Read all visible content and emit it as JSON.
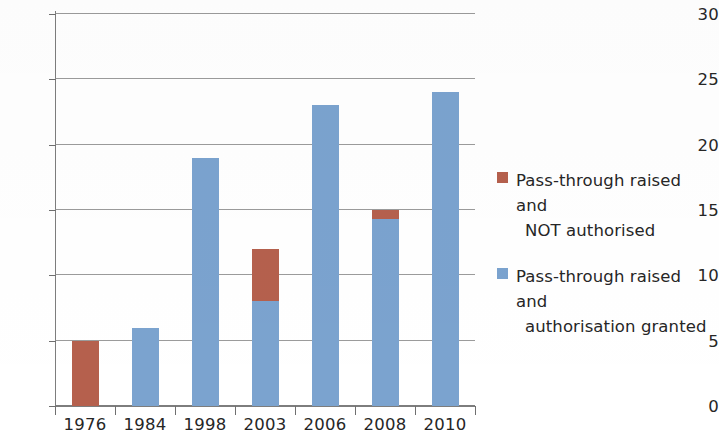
{
  "chart_data": {
    "type": "bar",
    "subtype": "stacked-vertical",
    "title": "",
    "subtitle": "",
    "xlabel": "",
    "ylabel": "",
    "categories": [
      "1976",
      "1984",
      "1998",
      "2003",
      "2006",
      "2008",
      "2010"
    ],
    "series": [
      {
        "name": "Pass-through raised and authorisation granted",
        "color": "#7ba3cf",
        "values": [
          0,
          6,
          19,
          8,
          23,
          14.3,
          24
        ]
      },
      {
        "name": "Pass-through raised and NOT authorised",
        "color": "#b5604d",
        "values": [
          5,
          0,
          0,
          4,
          0,
          0.7,
          0
        ]
      }
    ],
    "totals": [
      5,
      6,
      19,
      12,
      23,
      15,
      24
    ],
    "ylim": [
      0,
      30
    ],
    "ytick_step": 5,
    "yticks": [
      "0",
      "5",
      "10",
      "15",
      "20",
      "25",
      "30"
    ],
    "grid": true,
    "grid_axis": "y",
    "legend_position": "right"
  },
  "legend": {
    "entries": [
      {
        "color": "#b5604d",
        "line1": "Pass-through raised and",
        "line2": "NOT authorised"
      },
      {
        "color": "#7ba3cf",
        "line1": "Pass-through raised and",
        "line2": "authorisation granted"
      }
    ]
  },
  "colors": {
    "brown": "#b5604d",
    "blue": "#7ba3cf",
    "gridline": "#8a8a8a",
    "axis": "#7d7d7d",
    "text": "#262626",
    "background": "#ffffff"
  }
}
